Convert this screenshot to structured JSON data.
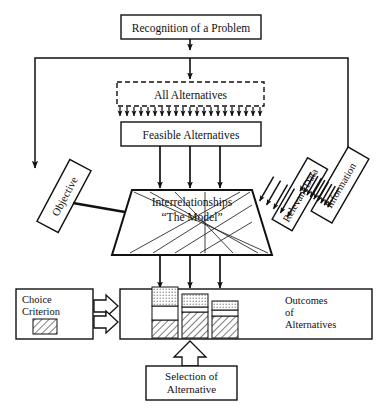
{
  "diagram": {
    "nodes": {
      "recognition": {
        "label": "Recognition of a Problem",
        "shape": "rectangle"
      },
      "all_alternatives": {
        "label": "All Alternatives",
        "shape": "dashed-rectangle"
      },
      "feasible_alternatives": {
        "label": "Feasible Alternatives",
        "shape": "rectangle"
      },
      "objective": {
        "label": "Objective",
        "shape": "rotated-rectangle"
      },
      "relevant_data": {
        "label": "Relevant Data",
        "shape": "rotated-rectangle"
      },
      "information": {
        "label": "Information",
        "shape": "rotated-rectangle"
      },
      "model": {
        "label_line1": "Interrelationships",
        "label_line2": "“The Model”",
        "shape": "trapezoid"
      },
      "choice_criterion": {
        "label_line1": "Choice",
        "label_line2": "Criterion",
        "shape": "rectangle",
        "swatch": "hatched"
      },
      "outcomes": {
        "label_line1": "Outcomes",
        "label_line2": "of",
        "label_line3": "Alternatives",
        "shape": "rectangle"
      },
      "selection": {
        "label_line1": "Selection of",
        "label_line2": "Alternative",
        "shape": "rectangle"
      }
    },
    "bars": [
      {
        "name": "alternative-1",
        "hatched": 18,
        "white": 14,
        "dotted": 19
      },
      {
        "name": "alternative-2",
        "hatched": 26,
        "white": 5,
        "dotted": 13
      },
      {
        "name": "alternative-3",
        "hatched": 22,
        "white": 6,
        "dotted": 9
      }
    ],
    "arrow_counts": {
      "all_to_feasible": 21,
      "feasible_to_model": 3,
      "model_to_outcomes": 3,
      "information_to_relevant_data": 9,
      "relevant_data_to_model": 5,
      "model_internal_lines": 8
    },
    "colors": {
      "stroke": "#111111",
      "background": "#ffffff",
      "hatch_fill": "#ffffff",
      "dot_fill": "#dcdcdc"
    }
  }
}
